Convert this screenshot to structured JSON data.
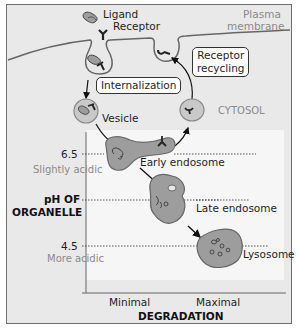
{
  "labels": {
    "ligand": "Ligand",
    "receptor": "Receptor",
    "plasma_membrane_line1": "Plasma",
    "plasma_membrane_line2": "membrane",
    "internalization": "Internalization",
    "receptor_recycling_line1": "Receptor",
    "receptor_recycling_line2": "recycling",
    "cytosol": "CYTOSOL",
    "vesicle": "Vesicle",
    "early_endosome": "Early endosome",
    "late_endosome": "Late endosome",
    "lysosome": "Lysosome"
  },
  "y_axis": {
    "title_line1": "pH OF",
    "title_line2": "ORGANELLE",
    "ticks": [
      {
        "value": "6.5",
        "note": "Slightly acidic"
      },
      {
        "value": "4.5",
        "note": "More acidic"
      }
    ]
  },
  "x_axis": {
    "title": "DEGRADATION",
    "min_label": "Minimal",
    "max_label": "Maximal"
  },
  "colors": {
    "background": "#e9e9e9",
    "panel": "#f6f6f6",
    "organelle_fill": "#9b9b9b",
    "vesicle_fill": "#c8c8c8",
    "outline": "#555555",
    "text_grey": "#8a8a8a"
  }
}
